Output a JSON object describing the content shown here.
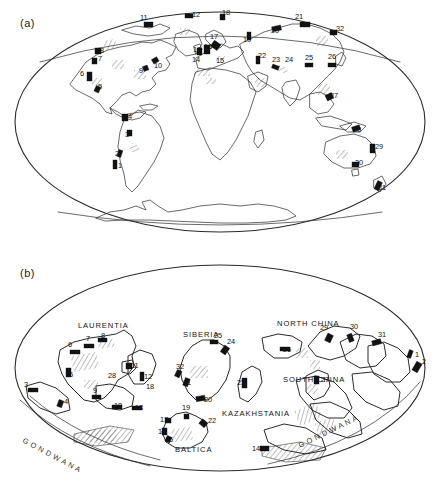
{
  "figure": {
    "type": "two-panel paleogeographic world map",
    "panels": [
      {
        "id": "a",
        "label": "(a)",
        "caption_text": "(a)",
        "projection": "oval / Mollweide-like world map, present-day continents"
      },
      {
        "id": "b",
        "label": "(b)",
        "caption_text": "(b)",
        "projection": "oval / Mollweide-like world map, palaeocontinental reconstruction"
      }
    ]
  },
  "panel_a": {
    "label": "(a)",
    "locality_numbers": [
      {
        "n": "1",
        "x": 118,
        "y": 168,
        "region": "southern South America"
      },
      {
        "n": "2",
        "x": 115,
        "y": 156,
        "region": "central Andes"
      },
      {
        "n": "3",
        "x": 125,
        "y": 137,
        "region": "northern Andes / Peru"
      },
      {
        "n": "4",
        "x": 128,
        "y": 119,
        "region": "northwest South America"
      },
      {
        "n": "5",
        "x": 98,
        "y": 89,
        "region": "southwest North America"
      },
      {
        "n": "6",
        "x": 80,
        "y": 76,
        "region": "western North America"
      },
      {
        "n": "7",
        "x": 98,
        "y": 61,
        "region": "northwest North America"
      },
      {
        "n": "8",
        "x": 100,
        "y": 53,
        "region": "Alaska / Yukon"
      },
      {
        "n": "9",
        "x": 139,
        "y": 73,
        "region": "central North America"
      },
      {
        "n": "10",
        "x": 154,
        "y": 68,
        "region": "eastern North America / Appalachians"
      },
      {
        "n": "11",
        "x": 140,
        "y": 20,
        "region": "Arctic Canada"
      },
      {
        "n": "12",
        "x": 192,
        "y": 17,
        "region": "Greenland / Svalbard"
      },
      {
        "n": "13",
        "x": 193,
        "y": 52,
        "region": "British Isles"
      },
      {
        "n": "14",
        "x": 192,
        "y": 62,
        "region": "Iberia / western Europe"
      },
      {
        "n": "15",
        "x": 216,
        "y": 63,
        "region": "central Europe"
      },
      {
        "n": "16",
        "x": 204,
        "y": 49,
        "region": "North Sea / Scandinavia"
      },
      {
        "n": "17",
        "x": 210,
        "y": 39,
        "region": "Norway"
      },
      {
        "n": "18",
        "x": 222,
        "y": 15,
        "region": "Svalbard / Arctic"
      },
      {
        "n": "19",
        "x": 243,
        "y": 42,
        "region": "Novaya Zemlya / Urals"
      },
      {
        "n": "20",
        "x": 271,
        "y": 33,
        "region": "west Siberia"
      },
      {
        "n": "21",
        "x": 295,
        "y": 19,
        "region": "north Siberia"
      },
      {
        "n": "22",
        "x": 258,
        "y": 58,
        "region": "Caspian / Turan"
      },
      {
        "n": "23",
        "x": 272,
        "y": 62,
        "region": "central Asia"
      },
      {
        "n": "24",
        "x": 285,
        "y": 62,
        "region": "Tien Shan"
      },
      {
        "n": "25",
        "x": 305,
        "y": 60,
        "region": "Mongolia"
      },
      {
        "n": "26",
        "x": 328,
        "y": 59,
        "region": "northeast China"
      },
      {
        "n": "27",
        "x": 330,
        "y": 98,
        "region": "south China / Indochina"
      },
      {
        "n": "28",
        "x": 353,
        "y": 132,
        "region": "New Guinea"
      },
      {
        "n": "29",
        "x": 375,
        "y": 149,
        "region": "eastern Australia"
      },
      {
        "n": "30",
        "x": 355,
        "y": 165,
        "region": "Tasmania / SE Australia"
      },
      {
        "n": "31",
        "x": 378,
        "y": 190,
        "region": "New Zealand"
      },
      {
        "n": "32",
        "x": 336,
        "y": 31,
        "region": "northeast Siberia"
      }
    ]
  },
  "panel_b": {
    "label": "(b)",
    "terrane_names": [
      {
        "text": "LAURENTIA",
        "x": 78,
        "y": 78
      },
      {
        "text": "SIBERIA",
        "x": 183,
        "y": 87
      },
      {
        "text": "NORTH CHINA",
        "x": 277,
        "y": 76
      },
      {
        "text": "SOUTH CHINA",
        "x": 283,
        "y": 132
      },
      {
        "text": "KAZAKHSTANIA",
        "x": 222,
        "y": 166
      },
      {
        "text": "BALTICA",
        "x": 175,
        "y": 202
      }
    ],
    "gondwana_labels": [
      {
        "text": "G O N D W A N A",
        "x": 22,
        "y": 192
      },
      {
        "text": "G O N D W A N A",
        "x": 300,
        "y": 198
      }
    ],
    "locality_numbers": [
      {
        "n": "1",
        "x": 415,
        "y": 107,
        "terrane": "eastern margin"
      },
      {
        "n": "2",
        "x": 422,
        "y": 114,
        "terrane": "eastern margin"
      },
      {
        "n": "3",
        "x": 24,
        "y": 137,
        "terrane": "Gondwana margin"
      },
      {
        "n": "4",
        "x": 64,
        "y": 154,
        "terrane": "Gondwana margin"
      },
      {
        "n": "5",
        "x": 69,
        "y": 127,
        "terrane": "Laurentia"
      },
      {
        "n": "6",
        "x": 68,
        "y": 97,
        "terrane": "Laurentia"
      },
      {
        "n": "7",
        "x": 86,
        "y": 91,
        "terrane": "Laurentia"
      },
      {
        "n": "8",
        "x": 101,
        "y": 88,
        "terrane": "Laurentia"
      },
      {
        "n": "9",
        "x": 93,
        "y": 143,
        "terrane": "Laurentia"
      },
      {
        "n": "10",
        "x": 114,
        "y": 158,
        "terrane": "Laurentia"
      },
      {
        "n": "11",
        "x": 131,
        "y": 118,
        "terrane": "Laurentia"
      },
      {
        "n": "12",
        "x": 144,
        "y": 129,
        "terrane": "Laurentia"
      },
      {
        "n": "13",
        "x": 135,
        "y": 160,
        "terrane": "Laurentia"
      },
      {
        "n": "14",
        "x": 252,
        "y": 201,
        "terrane": "Gondwana margin"
      },
      {
        "n": "15",
        "x": 165,
        "y": 192,
        "terrane": "Baltica"
      },
      {
        "n": "16",
        "x": 158,
        "y": 184,
        "terrane": "Baltica"
      },
      {
        "n": "17",
        "x": 160,
        "y": 172,
        "terrane": "Baltica"
      },
      {
        "n": "18",
        "x": 146,
        "y": 139,
        "terrane": "Laurentia"
      },
      {
        "n": "19",
        "x": 182,
        "y": 160,
        "terrane": "Baltica"
      },
      {
        "n": "20",
        "x": 204,
        "y": 152,
        "terrane": "Siberia"
      },
      {
        "n": "21",
        "x": 183,
        "y": 135,
        "terrane": "Siberia"
      },
      {
        "n": "22",
        "x": 208,
        "y": 173,
        "terrane": "Baltica"
      },
      {
        "n": "23",
        "x": 237,
        "y": 135,
        "terrane": "Kazakhstania"
      },
      {
        "n": "24",
        "x": 227,
        "y": 94,
        "terrane": "Siberia"
      },
      {
        "n": "25",
        "x": 214,
        "y": 88,
        "terrane": "Siberia"
      },
      {
        "n": "26",
        "x": 283,
        "y": 102,
        "terrane": "North China"
      },
      {
        "n": "27",
        "x": 321,
        "y": 132,
        "terrane": "South China"
      },
      {
        "n": "28",
        "x": 108,
        "y": 128,
        "terrane": "Laurentia interior"
      },
      {
        "n": "29",
        "x": 320,
        "y": 80,
        "terrane": "eastern terranes"
      },
      {
        "n": "30",
        "x": 350,
        "y": 79,
        "terrane": "eastern terranes"
      },
      {
        "n": "31",
        "x": 378,
        "y": 87,
        "terrane": "eastern terranes"
      },
      {
        "n": "32",
        "x": 176,
        "y": 119,
        "terrane": "Siberia"
      }
    ]
  },
  "legend_keys": {
    "black_symbol": "solid black bar — locality / deposit",
    "hatched_symbol": "diagonal-ruled area — basin or facies belt"
  }
}
